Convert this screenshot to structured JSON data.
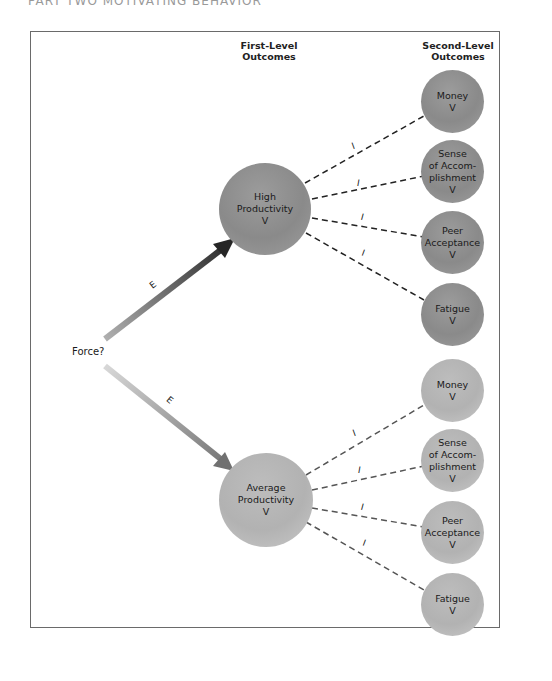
{
  "page_header": "PART TWO   MOTIVATING BEHAVIOR",
  "headers": {
    "first_level": [
      "First-Level",
      "Outcomes"
    ],
    "second_level": [
      "Second-Level",
      "Outcomes"
    ]
  },
  "force_label": "Force?",
  "expectancy_label": "E",
  "instrumentality_label": "I",
  "first_level": [
    {
      "lines": [
        "High",
        "Productivity",
        "V"
      ]
    },
    {
      "lines": [
        "Average",
        "Productivity",
        "V"
      ]
    }
  ],
  "second_level_top": [
    {
      "lines": [
        "Money",
        "V"
      ]
    },
    {
      "lines": [
        "Sense",
        "of Accom-",
        "plishment",
        "V"
      ]
    },
    {
      "lines": [
        "Peer",
        "Acceptance",
        "V"
      ]
    },
    {
      "lines": [
        "Fatigue",
        "V"
      ]
    }
  ],
  "second_level_bottom": [
    {
      "lines": [
        "Money",
        "V"
      ]
    },
    {
      "lines": [
        "Sense",
        "of Accom-",
        "plishment",
        "V"
      ]
    },
    {
      "lines": [
        "Peer",
        "Acceptance",
        "V"
      ]
    },
    {
      "lines": [
        "Fatigue",
        "V"
      ]
    }
  ],
  "colors": {
    "top_arrow_start": "#a8a8a8",
    "top_arrow_end": "#2a2a2a",
    "bottom_arrow_start": "#d4d4d4",
    "bottom_arrow_end": "#7a7a7a",
    "dark_node": "#8f8f8f",
    "light_node": "#b8b8b8",
    "frame_border": "#6a6a6a"
  }
}
